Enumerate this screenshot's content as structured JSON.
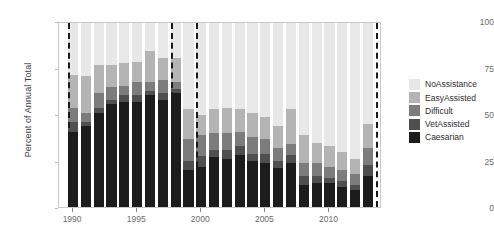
{
  "chart_data": {
    "type": "bar",
    "stacked": true,
    "title": "",
    "xlabel": "",
    "ylabel": "Percent of Annual Total",
    "ylim": [
      0,
      100
    ],
    "yticks": [
      0,
      25,
      50,
      75,
      100
    ],
    "xticks": [
      1990,
      1995,
      2000,
      2005,
      2010
    ],
    "xlim": [
      1988.9,
      2014.1
    ],
    "grid": false,
    "legend_position": "right",
    "categories": [
      1990,
      1991,
      1992,
      1993,
      1994,
      1995,
      1996,
      1997,
      1998,
      1999,
      2000,
      2001,
      2002,
      2003,
      2004,
      2005,
      2006,
      2007,
      2008,
      2009,
      2010,
      2011,
      2012,
      2013
    ],
    "series": [
      {
        "name": "Caesarian",
        "color": "#1c1c1c",
        "values": [
          41,
          44,
          51,
          56,
          57,
          57,
          61,
          58,
          62,
          20,
          22,
          27,
          26,
          28,
          25,
          24,
          21,
          24,
          12,
          13,
          13,
          11,
          9,
          17
        ]
      },
      {
        "name": "VetAssisted",
        "color": "#4f4f4f",
        "values": [
          5,
          2,
          3,
          2,
          4,
          4,
          2,
          4,
          2,
          5,
          6,
          4,
          5,
          5,
          4,
          5,
          4,
          4,
          5,
          4,
          3,
          3,
          3,
          6
        ]
      },
      {
        "name": "Difficult",
        "color": "#7c7c7c",
        "values": [
          8,
          5,
          8,
          7,
          5,
          7,
          5,
          7,
          4,
          12,
          11,
          9,
          9,
          8,
          9,
          8,
          7,
          6,
          7,
          7,
          6,
          6,
          6,
          9
        ]
      },
      {
        "name": "EasyAssisted",
        "color": "#b4b4b4",
        "values": [
          18,
          20,
          15,
          12,
          12,
          11,
          17,
          12,
          13,
          16,
          11,
          13,
          14,
          12,
          13,
          12,
          12,
          19,
          15,
          11,
          11,
          10,
          8,
          13
        ]
      },
      {
        "name": "NoAssistance",
        "color": "#e8e8e8",
        "values": [
          28,
          29,
          23,
          23,
          22,
          21,
          15,
          19,
          19,
          47,
          50,
          47,
          46,
          47,
          49,
          51,
          56,
          47,
          61,
          65,
          67,
          70,
          74,
          55
        ]
      }
    ],
    "reference_lines": [
      {
        "name": "vline-1",
        "x": 1989.6,
        "style": "dashed",
        "color": "#1a1a1a"
      },
      {
        "name": "vline-2",
        "x": 1997.6,
        "style": "dashed",
        "color": "#1a1a1a"
      },
      {
        "name": "vline-3",
        "x": 1999.6,
        "style": "dashed",
        "color": "#1a1a1a"
      },
      {
        "name": "vline-4",
        "x": 2013.6,
        "style": "dashed",
        "color": "#1a1a1a"
      }
    ]
  },
  "axes": {
    "ylabel": "Percent of Annual Total",
    "ytick_labels": [
      "0",
      "25",
      "50",
      "75",
      "100"
    ],
    "xtick_labels": [
      "1990",
      "1995",
      "2000",
      "2005",
      "2010"
    ]
  },
  "legend": {
    "items": [
      {
        "label": "NoAssistance",
        "color": "#e8e8e8"
      },
      {
        "label": "EasyAssisted",
        "color": "#b4b4b4"
      },
      {
        "label": "Difficult",
        "color": "#7c7c7c"
      },
      {
        "label": "VetAssisted",
        "color": "#4f4f4f"
      },
      {
        "label": "Caesarian",
        "color": "#1c1c1c"
      }
    ]
  },
  "colors": {
    "frame": "#c9c9c9",
    "tick_text": "#6b6b6b",
    "axis_title": "#3c3c3c",
    "reference_line": "#1a1a1a",
    "background": "#ffffff"
  }
}
